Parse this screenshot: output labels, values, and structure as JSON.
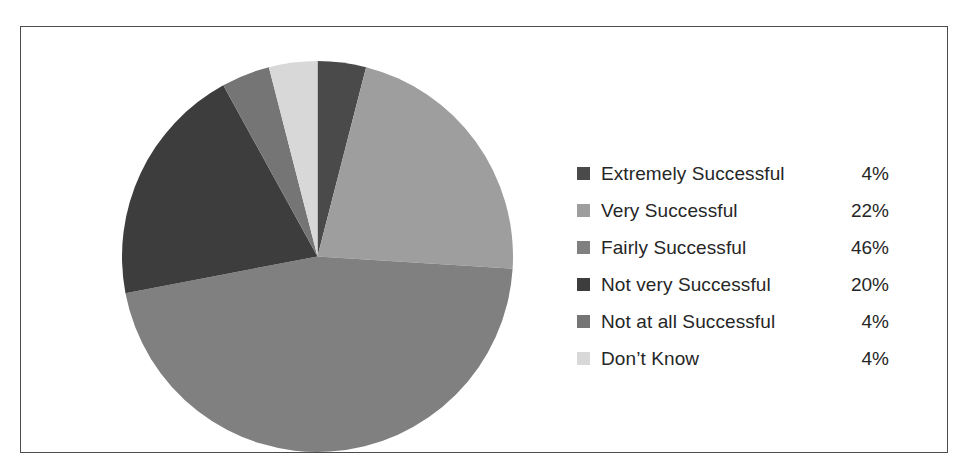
{
  "chart_data": {
    "type": "pie",
    "title": "",
    "subtitle": "",
    "xlabel": "",
    "ylabel": "",
    "legend_position": "right",
    "grid": false,
    "start_angle_deg": 0,
    "direction": "clockwise",
    "categories": [
      "Extremely Successful",
      "Very Successful",
      "Fairly Successful",
      "Not very Successful",
      "Not at all Successful",
      "Don’t Know"
    ],
    "values": [
      4,
      22,
      46,
      20,
      4,
      4
    ],
    "value_labels": [
      "4%",
      "22%",
      "46%",
      "20%",
      "4%",
      "4%"
    ],
    "unit": "%",
    "total": 100,
    "colors": [
      "#4a4a4a",
      "#9e9e9e",
      "#808080",
      "#3d3d3d",
      "#757575",
      "#d8d8d8"
    ],
    "slices": [
      {
        "label": "Extremely Successful",
        "value": 4,
        "value_label": "4%",
        "color": "#4a4a4a"
      },
      {
        "label": "Very Successful",
        "value": 22,
        "value_label": "22%",
        "color": "#9e9e9e"
      },
      {
        "label": "Fairly Successful",
        "value": 46,
        "value_label": "46%",
        "color": "#808080"
      },
      {
        "label": "Not very Successful",
        "value": 20,
        "value_label": "20%",
        "color": "#3d3d3d"
      },
      {
        "label": "Not at all Successful",
        "value": 4,
        "value_label": "4%",
        "color": "#757575"
      },
      {
        "label": "Don’t Know",
        "value": 4,
        "value_label": "4%",
        "color": "#d8d8d8"
      }
    ]
  },
  "legend": {
    "items": [
      {
        "label": "Extremely Successful",
        "value": "4%",
        "color": "#4a4a4a",
        "swatch_icon": "square-swatch-icon"
      },
      {
        "label": "Very Successful",
        "value": "22%",
        "color": "#9e9e9e",
        "swatch_icon": "square-swatch-icon"
      },
      {
        "label": "Fairly Successful",
        "value": "46%",
        "color": "#808080",
        "swatch_icon": "square-swatch-icon"
      },
      {
        "label": "Not very Successful",
        "value": "20%",
        "color": "#3d3d3d",
        "swatch_icon": "square-swatch-icon"
      },
      {
        "label": "Not at all Successful",
        "value": "4%",
        "color": "#757575",
        "swatch_icon": "square-swatch-icon"
      },
      {
        "label": "Don’t Know",
        "value": "4%",
        "color": "#d8d8d8",
        "swatch_icon": "square-swatch-icon"
      }
    ]
  },
  "frame": {
    "border_color": "#4c4c4c",
    "background": "#ffffff"
  }
}
